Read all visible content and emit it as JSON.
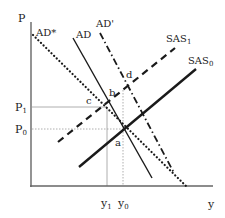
{
  "diagram": {
    "type": "AD-AS model",
    "axes": {
      "y_axis_label": "P",
      "x_axis_label": "y",
      "price_ticks": [
        {
          "base": "P",
          "sub": "1"
        },
        {
          "base": "P",
          "sub": "0"
        }
      ],
      "output_ticks": [
        {
          "base": "y",
          "sub": "1"
        },
        {
          "base": "y",
          "sub": "0"
        }
      ]
    },
    "curves": [
      {
        "id": "ad_star",
        "label": "AD*",
        "style": "dotted"
      },
      {
        "id": "ad",
        "label": "AD",
        "style": "solid"
      },
      {
        "id": "ad_prime",
        "label": "AD'",
        "style": "dash-dot"
      },
      {
        "id": "sas1",
        "label_base": "SAS",
        "label_sub": "1",
        "style": "dashed"
      },
      {
        "id": "sas0",
        "label_base": "SAS",
        "label_sub": "0",
        "style": "solid-thick"
      }
    ],
    "points": [
      {
        "label": "a"
      },
      {
        "label": "b"
      },
      {
        "label": "c"
      },
      {
        "label": "d"
      }
    ],
    "colors": {
      "curve": "#1a1a1a",
      "axis": "#666666",
      "guide": "#9a9a9a"
    }
  }
}
